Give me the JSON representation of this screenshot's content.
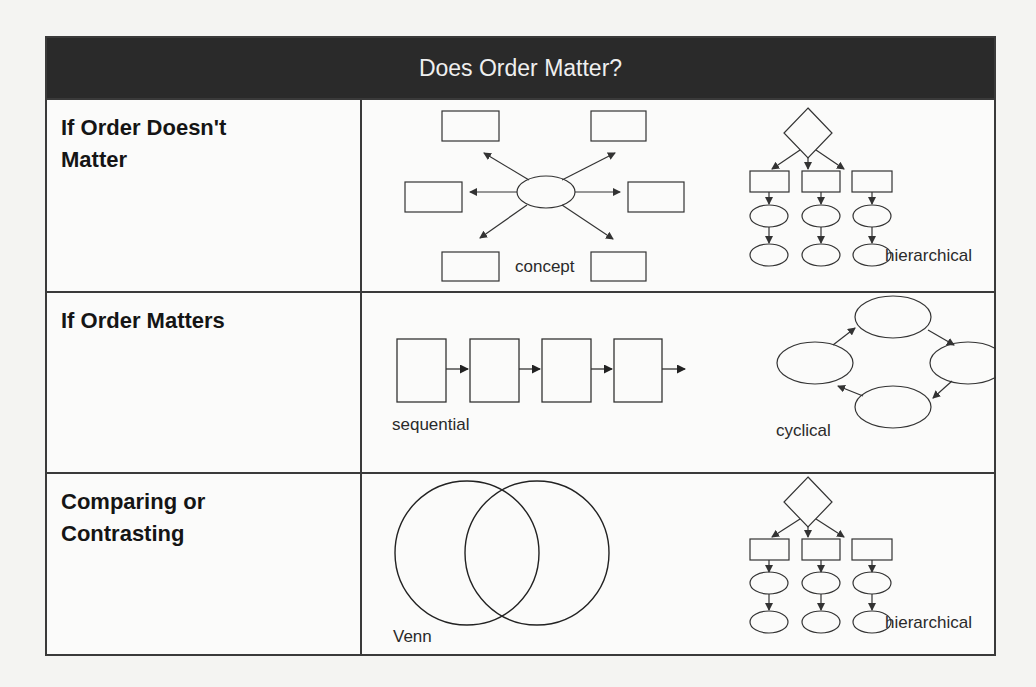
{
  "table": {
    "title": "Does Order Matter?",
    "rows": [
      {
        "label_lines": [
          "If Order Doesn't",
          "Matter"
        ],
        "diagrams": [
          {
            "type": "concept",
            "caption": "concept"
          },
          {
            "type": "hierarchical",
            "caption": "hierarchical"
          }
        ]
      },
      {
        "label_lines": [
          "If Order Matters"
        ],
        "diagrams": [
          {
            "type": "sequential",
            "caption": "sequential"
          },
          {
            "type": "cyclical",
            "caption": "cyclical"
          }
        ]
      },
      {
        "label_lines": [
          "Comparing or",
          "Contrasting"
        ],
        "diagrams": [
          {
            "type": "venn",
            "caption": "Venn"
          },
          {
            "type": "hierarchical",
            "caption": "hierarchical"
          }
        ]
      }
    ]
  },
  "colors": {
    "header_bg": "#2a2a2a",
    "header_text": "#efefef",
    "border": "#3a3a3a",
    "stroke": "#333333"
  }
}
